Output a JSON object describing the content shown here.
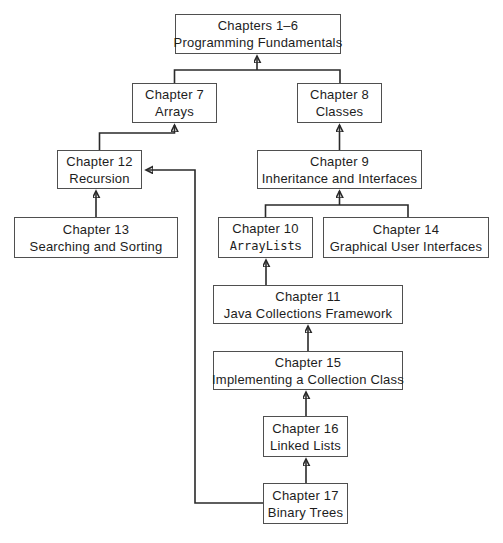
{
  "nodes": {
    "ch1_6": {
      "line1": "Chapters 1–6",
      "line2": "Programming Fundamentals"
    },
    "ch7": {
      "line1": "Chapter 7",
      "line2": "Arrays"
    },
    "ch8": {
      "line1": "Chapter 8",
      "line2": "Classes"
    },
    "ch12": {
      "line1": "Chapter 12",
      "line2": "Recursion"
    },
    "ch9": {
      "line1": "Chapter 9",
      "line2": "Inheritance and Interfaces"
    },
    "ch13": {
      "line1": "Chapter 13",
      "line2": "Searching and Sorting"
    },
    "ch10": {
      "line1": "Chapter 10",
      "line2_code": "ArrayList",
      "line2_suffix": "s"
    },
    "ch14": {
      "line1": "Chapter 14",
      "line2": "Graphical User Interfaces"
    },
    "ch11": {
      "line1": "Chapter 11",
      "line2": "Java Collections Framework"
    },
    "ch15": {
      "line1": "Chapter 15",
      "line2": "Implementing a Collection Class"
    },
    "ch16": {
      "line1": "Chapter 16",
      "line2": "Linked Lists"
    },
    "ch17": {
      "line1": "Chapter 17",
      "line2": "Binary Trees"
    }
  },
  "edges": [
    {
      "from": "ch7",
      "to": "ch1_6"
    },
    {
      "from": "ch8",
      "to": "ch1_6"
    },
    {
      "from": "ch12",
      "to": "ch7"
    },
    {
      "from": "ch9",
      "to": "ch8"
    },
    {
      "from": "ch13",
      "to": "ch12"
    },
    {
      "from": "ch10",
      "to": "ch9"
    },
    {
      "from": "ch14",
      "to": "ch9"
    },
    {
      "from": "ch11",
      "to": "ch10"
    },
    {
      "from": "ch15",
      "to": "ch11"
    },
    {
      "from": "ch16",
      "to": "ch15"
    },
    {
      "from": "ch17",
      "to": "ch16"
    },
    {
      "from": "ch17",
      "to": "ch12"
    }
  ],
  "colors": {
    "background": "#ffffff",
    "box_border": "#4f4f4f",
    "text": "#1d1d1d",
    "line": "#2a2a2a"
  }
}
